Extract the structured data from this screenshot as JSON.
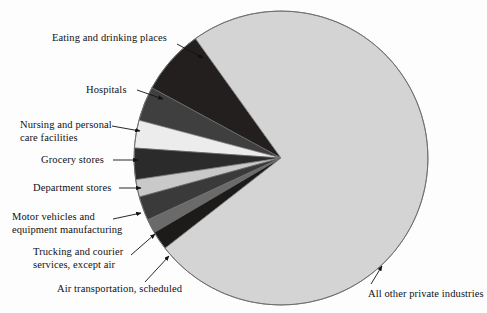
{
  "chart_data": {
    "type": "pie",
    "title": "",
    "subtitle": "",
    "xlabel": "",
    "ylabel": "",
    "legend_position": "callout-labels",
    "grid": false,
    "units": "share of total",
    "categories": [
      "Eating and drinking places",
      "Hospitals",
      "Nursing and personal care facilities",
      "Grocery stores",
      "Department stores",
      "Motor vehicles and equipment manufacturing",
      "Trucking and courier services, except air",
      "Air transportation, scheduled",
      "All other private industries"
    ],
    "values": [
      7.2,
      3.8,
      3.0,
      3.5,
      1.9,
      2.6,
      1.6,
      2.0,
      74.4
    ],
    "slices": [
      {
        "label": "Eating and drinking places",
        "value": 7.2,
        "color": "#231f1f",
        "start_angle": 125.6,
        "end_angle": 151.5
      },
      {
        "label": "Hospitals",
        "value": 3.8,
        "color": "#3f3f3f",
        "start_angle": 151.5,
        "end_angle": 165.1
      },
      {
        "label": "Nursing and personal care facilities",
        "value": 3.0,
        "color": "#ececec",
        "start_angle": 165.1,
        "end_angle": 176.1
      },
      {
        "label": "Grocery stores",
        "value": 3.5,
        "color": "#2b2b2b",
        "start_angle": 176.1,
        "end_angle": 188.5
      },
      {
        "label": "Department stores",
        "value": 1.9,
        "color": "#c9c9c9",
        "start_angle": 188.5,
        "end_angle": 195.4
      },
      {
        "label": "Motor vehicles and equipment manufacturing",
        "value": 2.6,
        "color": "#3a3a3a",
        "start_angle": 195.4,
        "end_angle": 204.9
      },
      {
        "label": "Trucking and courier services, except air",
        "value": 1.6,
        "color": "#6a6a6a",
        "start_angle": 204.9,
        "end_angle": 210.5
      },
      {
        "label": "Air transportation, scheduled",
        "value": 2.0,
        "color": "#1d1a1a",
        "start_angle": 210.5,
        "end_angle": 217.9
      },
      {
        "label": "All other private industries",
        "value": 74.4,
        "color": "#d4d4d4",
        "start_angle": 217.9,
        "end_angle": 485.6
      }
    ],
    "geometry": {
      "center_x": 281,
      "center_y": 158,
      "radius": 147
    },
    "colors": {
      "background": "#fdfdfd",
      "outline": "#6f6f6f",
      "text": "#111111",
      "leader_line": "#111111"
    }
  },
  "callouts": [
    {
      "name": "eating-and-drinking-places",
      "lines": [
        "Eating and drinking places"
      ],
      "text_x": 52,
      "text_y": 32,
      "align": "left",
      "line": {
        "x1": 177,
        "y1": 44,
        "x2": 203,
        "y2": 58
      }
    },
    {
      "name": "hospitals",
      "lines": [
        "Hospitals"
      ],
      "text_x": 86,
      "text_y": 84,
      "align": "left",
      "line": {
        "x1": 137,
        "y1": 90,
        "x2": 163,
        "y2": 99
      }
    },
    {
      "name": "nursing-and-personal-care-facilities",
      "lines": [
        "Nursing and personal",
        "care facilities"
      ],
      "text_x": 20,
      "text_y": 119,
      "align": "left",
      "line": {
        "x1": 112,
        "y1": 126,
        "x2": 140,
        "y2": 131
      }
    },
    {
      "name": "grocery-stores",
      "lines": [
        "Grocery stores"
      ],
      "text_x": 41,
      "text_y": 154,
      "align": "left",
      "line": {
        "x1": 113,
        "y1": 160,
        "x2": 138,
        "y2": 160
      }
    },
    {
      "name": "department-stores",
      "lines": [
        "Department stores"
      ],
      "text_x": 33,
      "text_y": 182,
      "align": "left",
      "line": {
        "x1": 119,
        "y1": 188,
        "x2": 141,
        "y2": 188
      }
    },
    {
      "name": "motor-vehicles-and-equipment-manufacturing",
      "lines": [
        "Motor vehicles and",
        "equipment manufacturing"
      ],
      "text_x": 12,
      "text_y": 211,
      "align": "left",
      "line": {
        "x1": 113,
        "y1": 219,
        "x2": 141,
        "y2": 213
      }
    },
    {
      "name": "trucking-and-courier-services-except-air",
      "lines": [
        "Trucking and courier",
        "services, except air"
      ],
      "text_x": 33,
      "text_y": 246,
      "align": "left",
      "line": {
        "x1": 131,
        "y1": 255,
        "x2": 155,
        "y2": 234
      }
    },
    {
      "name": "air-transportation-scheduled",
      "lines": [
        "Air transportation, scheduled"
      ],
      "text_x": 57,
      "text_y": 283,
      "align": "left",
      "line": {
        "x1": 145,
        "y1": 282,
        "x2": 169,
        "y2": 256
      }
    },
    {
      "name": "all-other-private-industries",
      "lines": [
        "All other private industries"
      ],
      "text_x": 368,
      "text_y": 288,
      "align": "left",
      "line": {
        "x1": 371,
        "y1": 284,
        "x2": 382,
        "y2": 266
      }
    }
  ]
}
